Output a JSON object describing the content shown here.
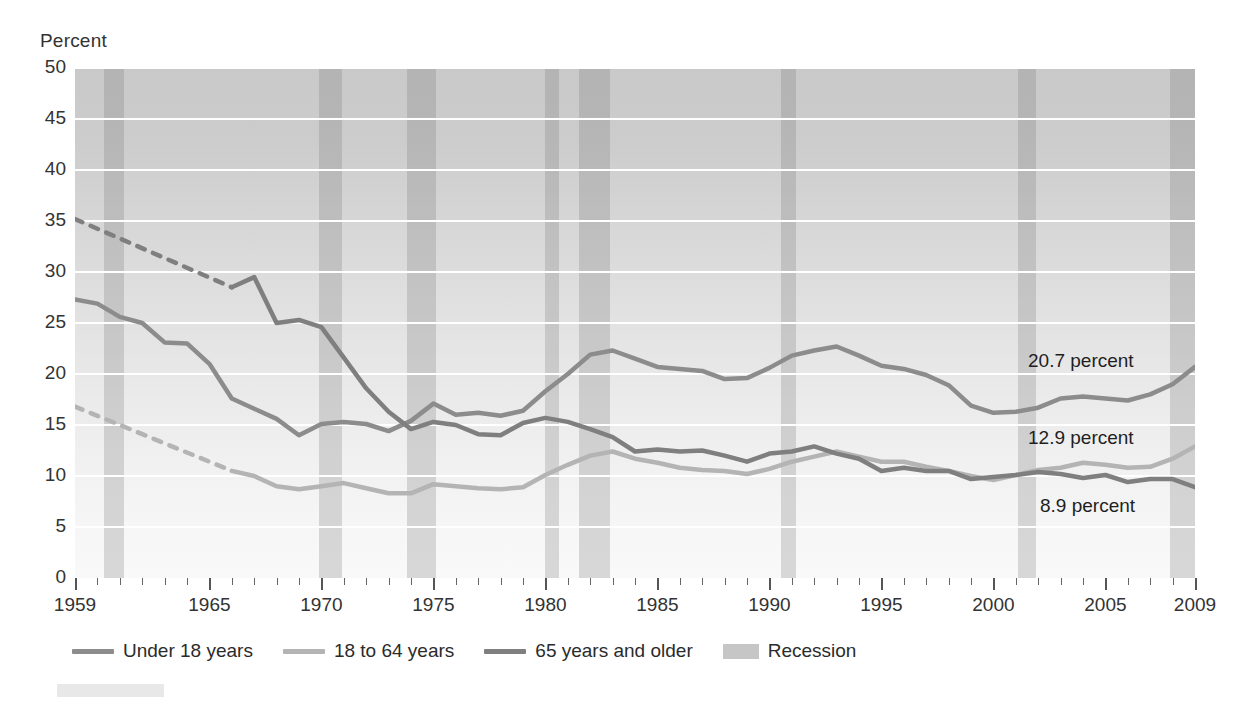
{
  "axis_title": "Percent",
  "annotations": [
    {
      "text": "20.7 percent",
      "series": "65 years and older",
      "value": 20.7,
      "year": 2009
    },
    {
      "text": "12.9 percent",
      "series": "Under 18 years",
      "value": 12.9,
      "year": 2009
    },
    {
      "text": "8.9 percent",
      "series": "18 to 64 years",
      "value": 8.9,
      "year": 2009
    }
  ],
  "legend": {
    "items": [
      {
        "label": "Under 18 years",
        "type": "line",
        "color": "#8c8c8c"
      },
      {
        "label": "18 to 64 years",
        "type": "line",
        "color": "#b4b4b4"
      },
      {
        "label": "65 years and older",
        "type": "line",
        "color": "#7f7f7f"
      },
      {
        "label": "Recession",
        "type": "box",
        "color": "#c6c6c6"
      }
    ]
  },
  "chart_data": {
    "type": "line",
    "title": "",
    "xlabel": "",
    "ylabel": "Percent",
    "xlim": [
      1959,
      2009
    ],
    "ylim": [
      0,
      50
    ],
    "ytick_values": [
      0,
      5,
      10,
      15,
      20,
      25,
      30,
      35,
      40,
      45,
      50
    ],
    "ytick_labels": [
      "0",
      "5",
      "10",
      "15",
      "20",
      "25",
      "30",
      "35",
      "40",
      "45",
      "50"
    ],
    "xtick_major_values": [
      1959,
      1965,
      1970,
      1975,
      1980,
      1985,
      1990,
      1995,
      2000,
      2005,
      2009
    ],
    "xtick_major_labels": [
      "1959",
      "1965",
      "1970",
      "1975",
      "1980",
      "1985",
      "1990",
      "1995",
      "2000",
      "2005",
      "2009"
    ],
    "xtick_minor_step": 1,
    "grid": "horizontal",
    "legend_position": "below-axes",
    "x": [
      1959,
      1960,
      1961,
      1962,
      1963,
      1964,
      1965,
      1966,
      1967,
      1968,
      1969,
      1970,
      1971,
      1972,
      1973,
      1974,
      1975,
      1976,
      1977,
      1978,
      1979,
      1980,
      1981,
      1982,
      1983,
      1984,
      1985,
      1986,
      1987,
      1988,
      1989,
      1990,
      1991,
      1992,
      1993,
      1994,
      1995,
      1996,
      1997,
      1998,
      1999,
      2000,
      2001,
      2002,
      2003,
      2004,
      2005,
      2006,
      2007,
      2008,
      2009
    ],
    "series": [
      {
        "name": "Under 18 years",
        "color": "#8c8c8c",
        "dashed_segment": null,
        "values": [
          27.3,
          26.9,
          25.6,
          25.0,
          23.1,
          23.0,
          21.0,
          17.6,
          16.6,
          15.6,
          14.0,
          15.1,
          15.3,
          15.1,
          14.4,
          15.4,
          17.1,
          16.0,
          16.2,
          15.9,
          16.4,
          18.3,
          20.0,
          21.9,
          22.3,
          21.5,
          20.7,
          20.5,
          20.3,
          19.5,
          19.6,
          20.6,
          21.8,
          22.3,
          22.7,
          21.8,
          20.8,
          20.5,
          19.9,
          18.9,
          16.9,
          16.2,
          16.3,
          16.7,
          17.6,
          17.8,
          17.6,
          17.4,
          18.0,
          19.0,
          20.7
        ]
      },
      {
        "name": "18 to 64 years",
        "color": "#b4b4b4",
        "dashed_segment": {
          "x": [
            1959,
            1966
          ],
          "values": [
            16.8,
            10.5
          ]
        },
        "values": [
          16.8,
          15.9,
          15.2,
          14.5,
          13.8,
          13.1,
          11.8,
          10.5,
          10.0,
          9.0,
          8.7,
          9.0,
          9.3,
          8.8,
          8.3,
          8.3,
          9.2,
          9.0,
          8.8,
          8.7,
          8.9,
          10.1,
          11.1,
          12.0,
          12.4,
          11.7,
          11.3,
          10.8,
          10.6,
          10.5,
          10.2,
          10.7,
          11.4,
          11.9,
          12.4,
          11.9,
          11.4,
          11.4,
          10.9,
          10.5,
          10.0,
          9.6,
          10.1,
          10.6,
          10.8,
          11.3,
          11.1,
          10.8,
          10.9,
          11.7,
          12.9
        ]
      },
      {
        "name": "65 years and older",
        "color": "#7f7f7f",
        "dashed_segment": {
          "x": [
            1959,
            1966
          ],
          "values": [
            35.2,
            28.5
          ]
        },
        "values": [
          35.2,
          34.2,
          33.3,
          32.4,
          31.5,
          30.6,
          29.6,
          28.5,
          29.5,
          25.0,
          25.3,
          24.6,
          21.6,
          18.6,
          16.3,
          14.6,
          15.3,
          15.0,
          14.1,
          14.0,
          15.2,
          15.7,
          15.3,
          14.6,
          13.8,
          12.4,
          12.6,
          12.4,
          12.5,
          12.0,
          11.4,
          12.2,
          12.4,
          12.9,
          12.2,
          11.7,
          10.5,
          10.8,
          10.5,
          10.5,
          9.7,
          9.9,
          10.1,
          10.4,
          10.2,
          9.8,
          10.1,
          9.4,
          9.7,
          9.7,
          8.9
        ]
      }
    ],
    "recessions": [
      {
        "start": 1960.3,
        "end": 1961.2
      },
      {
        "start": 1969.9,
        "end": 1970.9
      },
      {
        "start": 1973.8,
        "end": 1975.1
      },
      {
        "start": 1980.0,
        "end": 1980.6
      },
      {
        "start": 1981.5,
        "end": 1982.9
      },
      {
        "start": 1990.5,
        "end": 1991.2
      },
      {
        "start": 2001.1,
        "end": 2001.9
      },
      {
        "start": 2007.9,
        "end": 2009.5
      }
    ]
  }
}
